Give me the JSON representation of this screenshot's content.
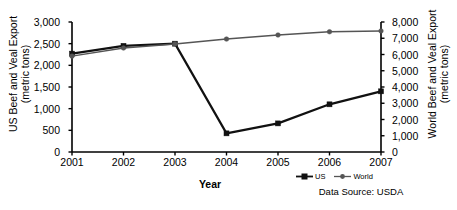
{
  "chart_data": {
    "type": "line",
    "title": "",
    "xlabel": "Year",
    "categories": [
      "2001",
      "2002",
      "2003",
      "2004",
      "2005",
      "2006",
      "2007"
    ],
    "x": [
      2001,
      2002,
      2003,
      2004,
      2005,
      2006,
      2007
    ],
    "grid": false,
    "legend_position": "bottom-right",
    "series": [
      {
        "name": "US",
        "axis": "left",
        "marker": "square",
        "color": "#111111",
        "values": [
          2270,
          2450,
          2500,
          430,
          660,
          1100,
          1400
        ]
      },
      {
        "name": "World",
        "axis": "right",
        "marker": "circle",
        "color": "#555555",
        "values": [
          5900,
          6400,
          6650,
          6950,
          7200,
          7400,
          7450
        ]
      }
    ],
    "axes": {
      "left": {
        "label_line1": "US Beef and Veal Export",
        "label_line2": "(metric tons)",
        "ylim": [
          0,
          3000
        ],
        "ticks": [
          0,
          500,
          1000,
          1500,
          2000,
          2500,
          3000
        ],
        "tick_labels": [
          "0",
          "500",
          "1,000",
          "1,500",
          "2,000",
          "2,500",
          "3,000"
        ]
      },
      "right": {
        "label_line1": "World Beef and Veal Export",
        "label_line2": "(metric tons)",
        "ylim": [
          0,
          8000
        ],
        "ticks": [
          0,
          1000,
          2000,
          3000,
          4000,
          5000,
          6000,
          7000,
          8000
        ],
        "tick_labels": [
          "0",
          "1,000",
          "2,000",
          "3,000",
          "4,000",
          "5,000",
          "6,000",
          "7,000",
          "8,000"
        ]
      }
    },
    "annotations": {
      "source": "Data Source: USDA"
    }
  },
  "legend": {
    "items": [
      {
        "label": "US",
        "marker": "square"
      },
      {
        "label": "World",
        "marker": "circle"
      }
    ]
  }
}
